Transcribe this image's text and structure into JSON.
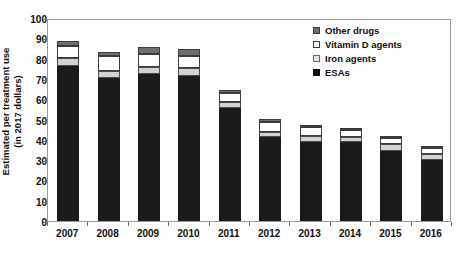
{
  "chart_data": {
    "type": "bar",
    "title": "",
    "subtitle": "",
    "xlabel": "",
    "ylabel": "Estimated per treatment use (in 2017 dollars)",
    "ylabel_lines": [
      "Estimated per treatment use",
      "(in 2017 dollars)"
    ],
    "stacked": true,
    "grid": false,
    "legend_position": "top-right",
    "ylim": [
      0,
      100
    ],
    "ytick_step": 10,
    "ytick_labels": [
      "100",
      "90",
      "80",
      "70",
      "60",
      "50",
      "40",
      "30",
      "20",
      "10",
      "0"
    ],
    "ytick_values": [
      100,
      90,
      80,
      70,
      60,
      50,
      40,
      30,
      20,
      10,
      0
    ],
    "categories": [
      "2007",
      "2008",
      "2009",
      "2010",
      "2011",
      "2012",
      "2013",
      "2014",
      "2015",
      "2016"
    ],
    "series": [
      {
        "name": "ESAs",
        "color": "#1b1b1b",
        "values": [
          76.5,
          70.5,
          72.5,
          71.5,
          55.5,
          41.5,
          39.0,
          39.0,
          34.5,
          30.0
        ]
      },
      {
        "name": "Iron agents",
        "color": "#d2d2d2",
        "values": [
          4.0,
          3.5,
          3.5,
          4.0,
          3.0,
          2.5,
          3.0,
          2.5,
          3.5,
          3.0
        ]
      },
      {
        "name": "Vitamin D agents",
        "color": "#ffffff",
        "values": [
          5.5,
          7.5,
          6.5,
          6.0,
          4.5,
          5.0,
          4.5,
          3.5,
          3.0,
          3.0
        ]
      },
      {
        "name": "Other drugs",
        "color": "#6e6e6e",
        "values": [
          2.5,
          2.0,
          3.0,
          3.0,
          1.5,
          1.5,
          1.0,
          1.0,
          0.5,
          0.5
        ]
      }
    ],
    "totals": [
      88.5,
      83.5,
      85.5,
      84.5,
      64.5,
      50.5,
      47.5,
      46.0,
      41.5,
      36.5
    ]
  },
  "legend": {
    "items": [
      {
        "label": "Other drugs",
        "swatch": "sw-other"
      },
      {
        "label": "Vitamin D agents",
        "swatch": "sw-vitd"
      },
      {
        "label": "Iron agents",
        "swatch": "sw-iron"
      },
      {
        "label": "ESAs",
        "swatch": "sw-esas"
      }
    ]
  }
}
